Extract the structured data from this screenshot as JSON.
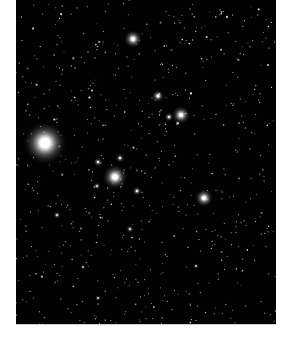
{
  "image": {
    "description": "Starfield photograph: dense field of faint stars on black background with several bright glowing stars",
    "background_color": "#020202",
    "page_color": "#ffffff",
    "frame": {
      "x": 16,
      "y": 0,
      "width": 260,
      "height": 324
    },
    "bright_stars": [
      {
        "x": 45,
        "y": 143,
        "r": 14,
        "glow": 1.0
      },
      {
        "x": 115,
        "y": 177,
        "r": 8,
        "glow": 0.9
      },
      {
        "x": 133,
        "y": 39,
        "r": 6,
        "glow": 0.8
      },
      {
        "x": 181,
        "y": 115,
        "r": 6,
        "glow": 0.8
      },
      {
        "x": 204,
        "y": 198,
        "r": 6,
        "glow": 0.8
      },
      {
        "x": 158,
        "y": 96,
        "r": 4,
        "glow": 0.7
      },
      {
        "x": 169,
        "y": 117,
        "r": 3,
        "glow": 0.6
      },
      {
        "x": 137,
        "y": 191,
        "r": 3,
        "glow": 0.6
      },
      {
        "x": 98,
        "y": 162,
        "r": 3,
        "glow": 0.55
      },
      {
        "x": 120,
        "y": 158,
        "r": 3,
        "glow": 0.55
      },
      {
        "x": 97,
        "y": 186,
        "r": 2.5,
        "glow": 0.5
      },
      {
        "x": 130,
        "y": 229,
        "r": 2.5,
        "glow": 0.5
      },
      {
        "x": 57,
        "y": 215,
        "r": 2.5,
        "glow": 0.5
      },
      {
        "x": 98,
        "y": 298,
        "r": 2,
        "glow": 0.45
      },
      {
        "x": 83,
        "y": 267,
        "r": 1.8,
        "glow": 0.4
      },
      {
        "x": 196,
        "y": 266,
        "r": 1.8,
        "glow": 0.4
      }
    ],
    "faint_star_count": 650
  }
}
